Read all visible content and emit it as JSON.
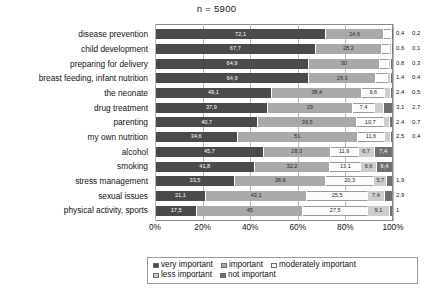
{
  "chart_data": {
    "type": "bar",
    "subtype": "stacked-horizontal-100",
    "title": "n = 5900",
    "xlabel": "",
    "ylabel": "",
    "xlim": [
      0,
      100
    ],
    "grid": true,
    "legend_position": "bottom",
    "xticks": [
      "0%",
      "20%",
      "40%",
      "60%",
      "80%",
      "100%"
    ],
    "categories": [
      "disease prevention",
      "child development",
      "preparing for delivery",
      "breast feeding, infant nutrition",
      "the neonate",
      "drug treatment",
      "parenting",
      "my own nutrition",
      "alcohol",
      "smoking",
      "stress management",
      "sexual issues",
      "physical activity, sports"
    ],
    "series": [
      {
        "name": "very important",
        "color": "#4a4a4a",
        "values": [
          72.1,
          67.7,
          64.9,
          64.9,
          49.1,
          37.9,
          40.7,
          34.6,
          45.7,
          41.8,
          33.5,
          21.1,
          17.5
        ],
        "labels": [
          "72,1",
          "67,7",
          "64,9",
          "64,9",
          "49,1",
          "37,9",
          "40,7",
          "34,6",
          "45,7",
          "41,8",
          "33,5",
          "21,1",
          "17,5"
        ]
      },
      {
        "name": "important",
        "color": "#a9a9a9",
        "values": [
          24.6,
          28.2,
          30,
          28.3,
          38.4,
          29,
          39.5,
          51,
          28.3,
          32.2,
          38.6,
          43.1,
          45
        ],
        "labels": [
          "24,6",
          "28,2",
          "30",
          "28,3",
          "38,4",
          "29",
          "39,5",
          "51",
          "28,3",
          "32,2",
          "38,6",
          "43,1",
          "45"
        ]
      },
      {
        "name": "moderately important",
        "color": "#fbfbfb",
        "values": [
          2.7,
          3.5,
          4.1,
          4.9,
          9.6,
          7.4,
          10.7,
          11.6,
          11.9,
          13.1,
          20.3,
          25.5,
          27.5
        ],
        "labels": [
          "2,7",
          "3,5",
          "4,1",
          "4,9",
          "9,6",
          "7,4",
          "10,7",
          "11,6",
          "11,9",
          "13,1",
          "20,3",
          "25,5",
          "27,5"
        ]
      },
      {
        "name": "less important",
        "color": "#cdcdcd",
        "values": [
          0.4,
          0.6,
          0.8,
          1.4,
          2.4,
          3.1,
          2.4,
          2.5,
          6.7,
          6.6,
          5.7,
          7.4,
          9.1
        ],
        "labels": [
          "0,4",
          "0,6",
          "0,8",
          "1,4",
          "2,4",
          "3,1",
          "2,4",
          "2,5",
          "6,7",
          "6,6",
          "5,7",
          "7,4",
          "9,1"
        ]
      },
      {
        "name": "not important",
        "color": "#6f6f6f",
        "values": [
          0.2,
          0.1,
          0.3,
          0.4,
          0.5,
          2.7,
          0.7,
          0.4,
          7.4,
          6.4,
          1.9,
          2.9,
          1
        ],
        "labels": [
          "0,2",
          "0,1",
          "0,3",
          "0,4",
          "0,5",
          "2,7",
          "0,7",
          "0,4",
          "7,4",
          "6,4",
          "1,9",
          "2,9",
          "1"
        ]
      }
    ],
    "inside_label_min_width": 5.5,
    "outside_labels": [
      [
        "0,4",
        "0,2"
      ],
      [
        "0,6",
        "0,1"
      ],
      [
        "0,8",
        "0,3"
      ],
      [
        "1,4",
        "0,4"
      ],
      [
        "2,4",
        "0,5"
      ],
      [
        "3,1",
        "2,7"
      ],
      [
        "2,4",
        "0,7"
      ],
      [
        "2,5",
        "0,4"
      ],
      [
        "",
        ""
      ],
      [
        "",
        ""
      ],
      [
        "1,9",
        ""
      ],
      [
        "2,9",
        ""
      ],
      [
        "1",
        ""
      ]
    ],
    "legend": [
      "very important",
      "important",
      "moderately important",
      "less important",
      "not important"
    ]
  }
}
